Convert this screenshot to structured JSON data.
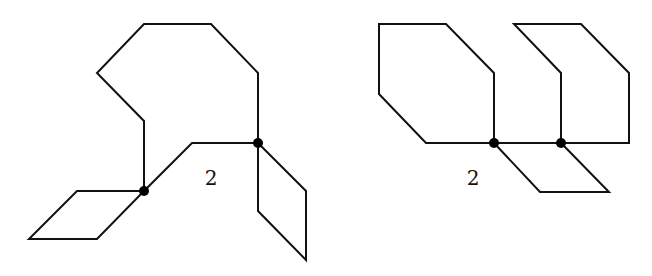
{
  "figures": [
    {
      "id": "left",
      "face_label": "2",
      "label_pos": [
        211,
        185
      ],
      "paths": [
        "M144,191 L144,121 L97,73 L144,24 L211,24 L258,73 L258,143",
        "M144,191 L192,143 L258,143",
        "M144,191 L77,191 L29,239 L97,239 Z",
        "M258,143 L306,191 L306,260 L258,211 Z"
      ],
      "vertices": [
        [
          144,
          191
        ],
        [
          258,
          143
        ]
      ]
    },
    {
      "id": "right",
      "face_label": "2",
      "label_pos": [
        473,
        185
      ],
      "paths": [
        "M494,143 L494,73 L446,24 L379,24 L379,94 L426,143 Z",
        "M561,143 L561,73 L514,24 L581,24 L629,73 L629,143 Z",
        "M494,143 L561,143",
        "M494,143 L540,192 L609,192 L561,143"
      ],
      "vertices": [
        [
          494,
          143
        ],
        [
          561,
          143
        ]
      ]
    }
  ],
  "style": {
    "stroke": "#111111",
    "vertex_fill": "#000000",
    "background": "#ffffff"
  }
}
